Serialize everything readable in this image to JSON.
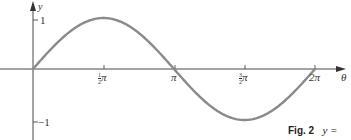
{
  "chart_data": {
    "type": "line",
    "title": "",
    "xlabel": "θ",
    "ylabel": "y",
    "x_ticks": [
      "½π",
      "π",
      "3/2π",
      "2π"
    ],
    "x_tick_values": [
      1.5708,
      3.1416,
      4.7124,
      6.2832
    ],
    "y_ticks": [
      "1",
      "−1"
    ],
    "y_tick_values": [
      1,
      -1
    ],
    "xlim": [
      0,
      6.2832
    ],
    "ylim": [
      -1,
      1
    ],
    "grid": false,
    "legend": null,
    "series": [
      {
        "name": "y = sin θ",
        "function": "sin",
        "x": [
          0,
          0.7854,
          1.5708,
          2.3562,
          3.1416,
          3.927,
          4.7124,
          5.4978,
          6.2832
        ],
        "values": [
          0,
          0.707,
          1,
          0.707,
          0,
          -0.707,
          -1,
          -0.707,
          0
        ],
        "color": "#8a8a8a"
      }
    ],
    "caption": "Fig. 2   y ="
  },
  "labels": {
    "y_axis": "y",
    "x_axis": "θ",
    "y_tick_pos": "1",
    "y_tick_neg": "−1",
    "x_tick_half_pi_num": "1",
    "x_tick_half_pi_den": "2",
    "x_tick_pi": "π",
    "x_tick_threehalf_num": "3",
    "x_tick_threehalf_den": "2",
    "x_tick_two_pi": "2π",
    "pi": "π"
  },
  "caption": {
    "fig": "Fig. 2",
    "text": "y ="
  },
  "colors": {
    "axis": "#333333",
    "curve": "#8a8a8a"
  }
}
